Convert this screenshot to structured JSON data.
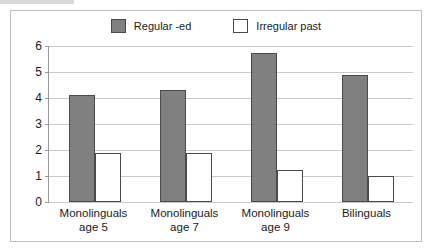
{
  "chart_data": {
    "type": "bar",
    "title": "",
    "xlabel": "",
    "ylabel": "",
    "ylim": [
      0,
      6
    ],
    "yticks": [
      0,
      1,
      2,
      3,
      4,
      5,
      6
    ],
    "grid": true,
    "legend_position": "top-center",
    "categories": [
      "Monolinguals\nage 5",
      "Monolinguals\nage 7",
      "Monolinguals\nage 9",
      "Bilinguals"
    ],
    "category_lines": [
      [
        "Monolinguals",
        "age 5"
      ],
      [
        "Monolinguals",
        "age 7"
      ],
      [
        "Monolinguals",
        "age 9"
      ],
      [
        "Bilinguals",
        ""
      ]
    ],
    "series": [
      {
        "name": "Regular -ed",
        "color": "#808080",
        "values": [
          4.1,
          4.3,
          5.75,
          4.9
        ]
      },
      {
        "name": "Irregular past",
        "color": "#ffffff",
        "values": [
          1.9,
          1.9,
          1.25,
          1.0
        ]
      }
    ]
  },
  "legend": {
    "items": [
      {
        "label": "Regular -ed",
        "swatch": "filled-gray-square"
      },
      {
        "label": "Irregular past",
        "swatch": "hollow-white-square"
      }
    ]
  },
  "axis": {
    "y_tick_labels": [
      "6",
      "5",
      "4",
      "3",
      "2",
      "1",
      "0"
    ]
  },
  "colors": {
    "regular_fill": "#808080",
    "irregular_fill": "#ffffff",
    "bar_outline": "#4a4a4a",
    "gridline": "#c9c9c9",
    "axis_line": "#9a9a9a",
    "frame_border": "#bfbfbf",
    "text": "#1a1a1a",
    "background": "#ffffff"
  }
}
